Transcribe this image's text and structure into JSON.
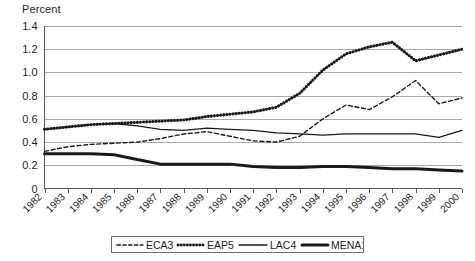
{
  "chart_data": {
    "type": "line",
    "title": "",
    "ylabel": "Percent",
    "xlabel": "",
    "ylim": [
      0,
      1.4
    ],
    "ytick_labels": [
      "0",
      "0.2",
      "0.4",
      "0.6",
      "0.8",
      "1.0",
      "1.2",
      "1.4"
    ],
    "ytick_values": [
      0,
      0.2,
      0.4,
      0.6,
      0.8,
      1.0,
      1.2,
      1.4
    ],
    "grid": true,
    "legend_position": "bottom",
    "categories": [
      "1982",
      "1983",
      "1984",
      "1985",
      "1986",
      "1987",
      "1988",
      "1989",
      "1990",
      "1991",
      "1992",
      "1993",
      "1994",
      "1995",
      "1996",
      "1997",
      "1998",
      "1999",
      "2000"
    ],
    "series": [
      {
        "name": "ECA3",
        "style": "dashed",
        "values": [
          0.32,
          0.36,
          0.38,
          0.39,
          0.4,
          0.43,
          0.47,
          0.49,
          0.45,
          0.41,
          0.4,
          0.45,
          0.6,
          0.72,
          0.68,
          0.79,
          0.93,
          0.73,
          0.78
        ]
      },
      {
        "name": "EAP5",
        "style": "dotted-thick",
        "values": [
          0.51,
          0.53,
          0.55,
          0.56,
          0.57,
          0.58,
          0.59,
          0.62,
          0.64,
          0.66,
          0.7,
          0.82,
          1.02,
          1.16,
          1.22,
          1.26,
          1.1,
          1.15,
          1.2
        ]
      },
      {
        "name": "LAC4",
        "style": "solid-thin",
        "values": [
          0.51,
          0.53,
          0.55,
          0.56,
          0.54,
          0.51,
          0.5,
          0.52,
          0.51,
          0.5,
          0.48,
          0.47,
          0.46,
          0.47,
          0.47,
          0.47,
          0.47,
          0.44,
          0.5
        ]
      },
      {
        "name": "MENA11",
        "style": "solid-thick",
        "values": [
          0.3,
          0.3,
          0.3,
          0.29,
          0.25,
          0.21,
          0.21,
          0.21,
          0.21,
          0.19,
          0.18,
          0.18,
          0.19,
          0.19,
          0.18,
          0.17,
          0.17,
          0.16,
          0.15
        ]
      }
    ]
  },
  "legend": {
    "items": [
      {
        "label": "ECA3",
        "style": "dashed"
      },
      {
        "label": "EAP5",
        "style": "dotted-thick"
      },
      {
        "label": "LAC4",
        "style": "solid-thin"
      },
      {
        "label": "MENA11",
        "style": "solid-thick"
      }
    ]
  },
  "colors": {
    "series": "#1a1a1a",
    "gridline": "#a7a9ac",
    "axis": "#58595b",
    "text": "#231f20",
    "background": "#ffffff"
  }
}
